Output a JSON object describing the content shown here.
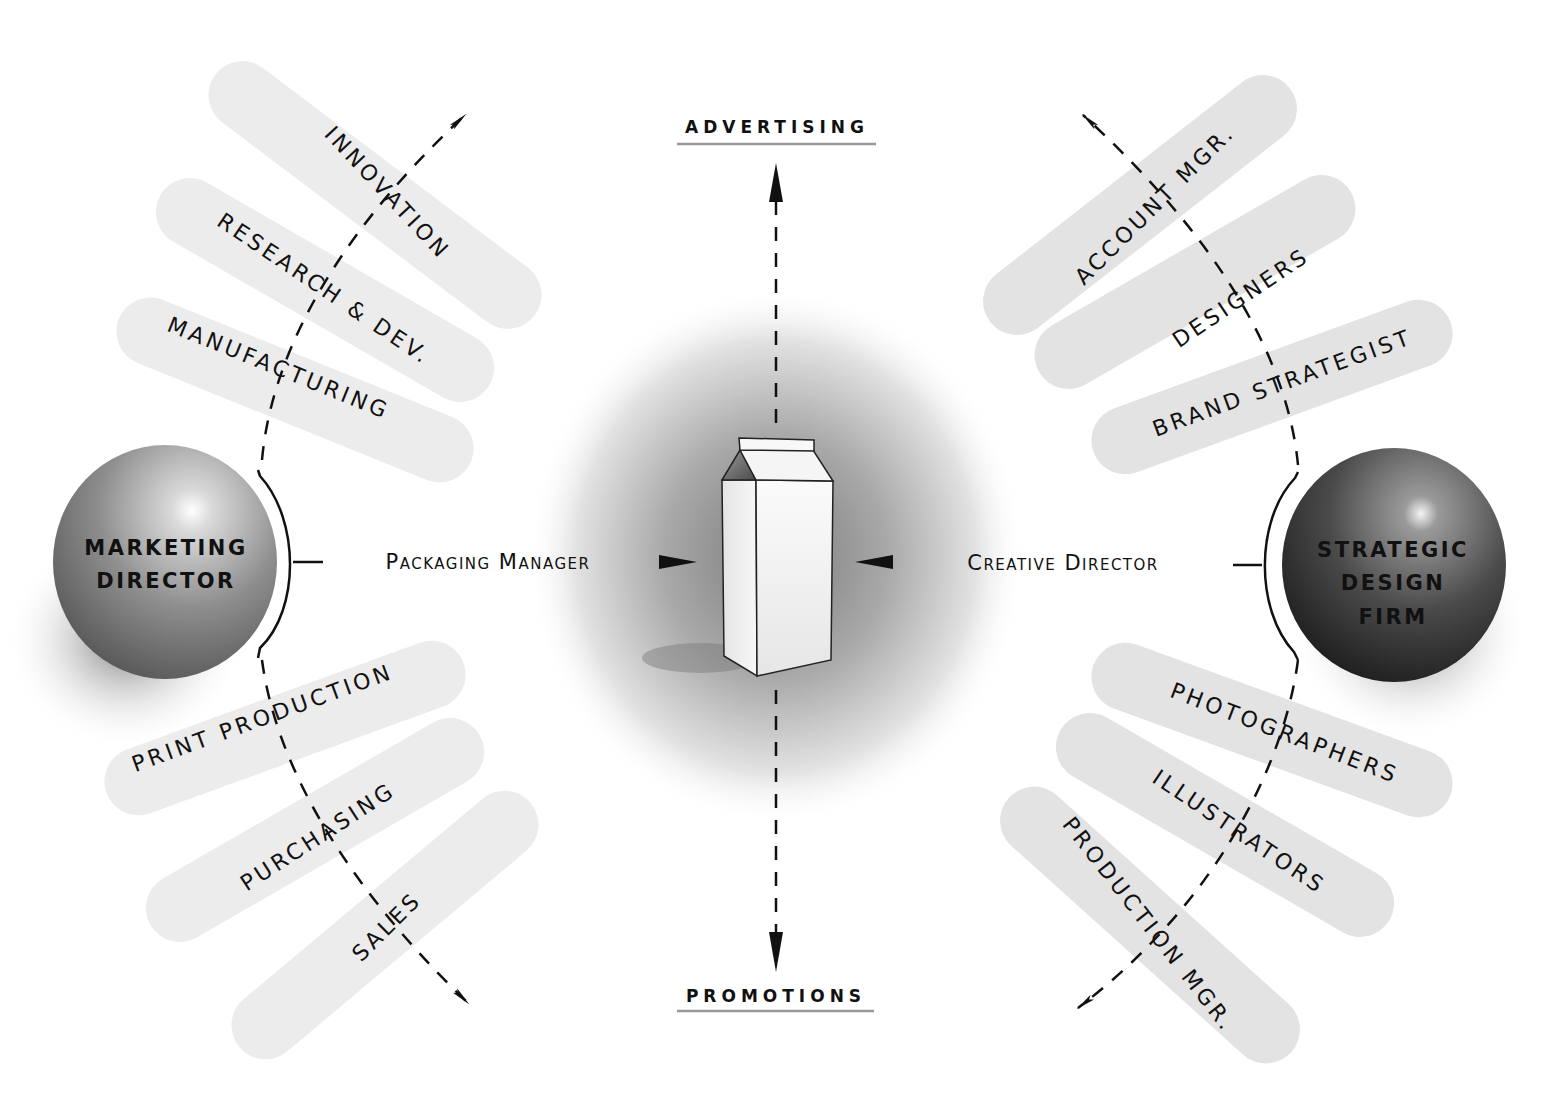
{
  "diagram": {
    "center": {
      "label": "product-carton"
    },
    "channels": {
      "top": "ADVERTISING",
      "bottom": "PROMOTIONS"
    },
    "left": {
      "sphere_lines": [
        "MARKETING",
        "DIRECTOR"
      ],
      "role": "Packaging Manager",
      "upper_pills": [
        "INNOVATION",
        "RESEARCH & DEV.",
        "MANUFACTURING"
      ],
      "lower_pills": [
        "PRINT PRODUCTION",
        "PURCHASING",
        "SALES"
      ]
    },
    "right": {
      "sphere_lines": [
        "STRATEGIC",
        "DESIGN",
        "FIRM"
      ],
      "role": "Creative Director",
      "upper_pills": [
        "ACCOUNT MGR.",
        "DESIGNERS",
        "BRAND STRATEGIST"
      ],
      "lower_pills": [
        "PHOTOGRAPHERS",
        "ILLUSTRATORS",
        "PRODUCTION MGR."
      ]
    },
    "colors": {
      "pill": "#ebebeb",
      "ink": "#111111",
      "rule": "#9a9a9a",
      "left_sphere": "#8a8a8a",
      "right_sphere": "#3c3c3c"
    }
  }
}
